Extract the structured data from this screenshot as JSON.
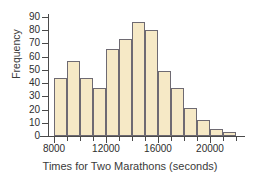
{
  "chart_data": {
    "type": "bar",
    "title": "",
    "xlabel": "Times for Two Marathons (seconds)",
    "ylabel": "Frequency",
    "grid": false,
    "legend": "none",
    "bin_width": 1000,
    "bin_starts": [
      8000,
      9000,
      10000,
      11000,
      12000,
      13000,
      14000,
      15000,
      16000,
      17000,
      18000,
      19000,
      20000,
      21000
    ],
    "categories": [
      "8000-9000",
      "9000-10000",
      "10000-11000",
      "11000-12000",
      "12000-13000",
      "13000-14000",
      "14000-15000",
      "15000-16000",
      "16000-17000",
      "17000-18000",
      "18000-19000",
      "19000-20000",
      "20000-21000",
      "21000-22000"
    ],
    "values": [
      44,
      57,
      44,
      36,
      66,
      73,
      86,
      80,
      49,
      36,
      21,
      12,
      5,
      3
    ],
    "xlim": [
      7500,
      22000
    ],
    "ylim": [
      0,
      90
    ],
    "xticks": [
      8000,
      12000,
      16000,
      20000
    ],
    "xtick_labels": [
      "8000",
      "12000",
      "16000",
      "20000"
    ],
    "yticks": [
      0,
      10,
      20,
      30,
      40,
      50,
      60,
      70,
      80,
      90
    ],
    "ytick_labels": [
      "0",
      "10",
      "20",
      "30",
      "40",
      "50",
      "60",
      "70",
      "80",
      "90"
    ],
    "bar_fill_color": "#f6e9c6",
    "bar_border_color": "#6e6a72",
    "axis_color": "#4a4a4a",
    "text_color": "#2e2e2e"
  }
}
